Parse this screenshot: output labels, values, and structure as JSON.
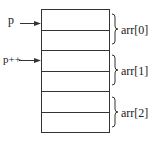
{
  "diagram": {
    "pointers": [
      {
        "label": "p",
        "row": 0
      },
      {
        "label": "p++",
        "row": 2
      }
    ],
    "groups": [
      {
        "label": "arr[0]"
      },
      {
        "label": "arr[1]"
      },
      {
        "label": "arr[2]"
      }
    ],
    "row_count": 6,
    "colors": {
      "line": "#333333",
      "background": "#ffffff"
    }
  }
}
